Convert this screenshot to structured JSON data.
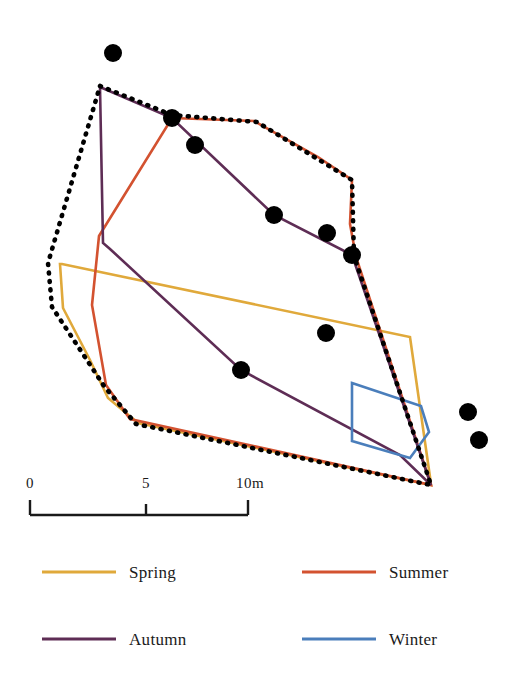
{
  "figure": {
    "background_color": "#ffffff",
    "width": 523,
    "height": 685
  },
  "chart_data": {
    "type": "map",
    "title": "",
    "subtitle": "",
    "xlabel": "",
    "ylabel": "",
    "grid": false,
    "legend_position": "bottom",
    "units": "m",
    "scale_bar": {
      "ticks": [
        "0",
        "5",
        "10m"
      ],
      "tick_values": [
        0,
        5,
        10
      ],
      "length_meters": 10,
      "pixel_length": 218,
      "meters_per_pixel": 0.0459,
      "color": "#1a1a1a"
    },
    "series": [
      {
        "name": "Spring",
        "color": "#E0A93B",
        "type": "polygon",
        "closed": true,
        "points": [
          [
            60,
            264
          ],
          [
            63,
            308
          ],
          [
            90,
            360
          ],
          [
            108,
            398
          ],
          [
            138,
            423
          ],
          [
            431,
            485
          ],
          [
            430,
            477
          ],
          [
            410,
            337
          ],
          [
            62,
            264
          ]
        ]
      },
      {
        "name": "Summer",
        "color": "#D35230",
        "type": "polygon",
        "closed": true,
        "points": [
          [
            172,
            118
          ],
          [
            254,
            121
          ],
          [
            318,
            157
          ],
          [
            352,
            180
          ],
          [
            350,
            224
          ],
          [
            356,
            257
          ],
          [
            431,
            485
          ],
          [
            130,
            419
          ],
          [
            106,
            385
          ],
          [
            92,
            305
          ],
          [
            99,
            236
          ],
          [
            172,
            118
          ]
        ]
      },
      {
        "name": "Autumn",
        "color": "#5E2D55",
        "type": "polygon",
        "closed": true,
        "points": [
          [
            100,
            87
          ],
          [
            172,
            118
          ],
          [
            274,
            215
          ],
          [
            352,
            255
          ],
          [
            431,
            485
          ],
          [
            400,
            455
          ],
          [
            241,
            370
          ],
          [
            110,
            249
          ],
          [
            103,
            243
          ],
          [
            100,
            87
          ]
        ]
      },
      {
        "name": "Winter",
        "color": "#4A7EBB",
        "type": "polygon",
        "closed": true,
        "points": [
          [
            352,
            383
          ],
          [
            421,
            406
          ],
          [
            429,
            432
          ],
          [
            410,
            458
          ],
          [
            352,
            441
          ],
          [
            352,
            383
          ]
        ]
      },
      {
        "name": "Total range boundary",
        "color": "#000000",
        "type": "polygon",
        "style": "dotted",
        "closed": true,
        "points": [
          [
            100,
            86
          ],
          [
            172,
            115
          ],
          [
            257,
            122
          ],
          [
            352,
            180
          ],
          [
            354,
            256
          ],
          [
            431,
            485
          ],
          [
            136,
            424
          ],
          [
            104,
            386
          ],
          [
            52,
            307
          ],
          [
            48,
            263
          ],
          [
            100,
            86
          ]
        ]
      }
    ],
    "points": {
      "name": "Observation points",
      "color": "#000000",
      "marker": "filled-circle",
      "radius": 9,
      "coordinates": [
        [
          113,
          53
        ],
        [
          172,
          118
        ],
        [
          195,
          145
        ],
        [
          274,
          215
        ],
        [
          327,
          233
        ],
        [
          352,
          255
        ],
        [
          326,
          333
        ],
        [
          241,
          370
        ],
        [
          468,
          412
        ],
        [
          479,
          440
        ]
      ]
    }
  },
  "legend": {
    "entries": [
      {
        "label": "Spring",
        "color": "#E0A93B"
      },
      {
        "label": "Summer",
        "color": "#D35230"
      },
      {
        "label": "Autumn",
        "color": "#5E2D55"
      },
      {
        "label": "Winter",
        "color": "#4A7EBB"
      }
    ]
  },
  "scale": {
    "tick_0": "0",
    "tick_5": "5",
    "tick_10": "10m"
  }
}
